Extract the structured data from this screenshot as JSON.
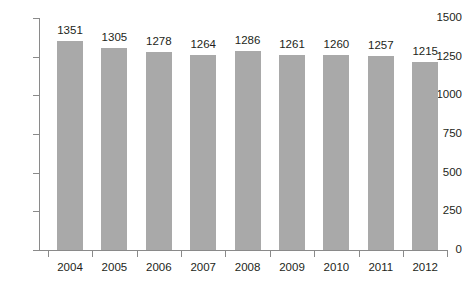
{
  "chart_data": {
    "type": "bar",
    "title": "",
    "subtitle": "",
    "xlabel": "",
    "ylabel": "",
    "categories": [
      "2004",
      "2005",
      "2006",
      "2007",
      "2008",
      "2009",
      "2010",
      "2011",
      "2012"
    ],
    "values": [
      1351,
      1305,
      1278,
      1264,
      1286,
      1261,
      1260,
      1257,
      1215
    ],
    "data_labels": [
      "1351",
      "1305",
      "1278",
      "1264",
      "1286",
      "1261",
      "1260",
      "1257",
      "1215"
    ],
    "ylim": [
      0,
      1500
    ],
    "yticks": [
      0,
      250,
      500,
      750,
      1000,
      1250,
      1500
    ],
    "ytick_labels": [
      "0",
      "250",
      "500",
      "750",
      "1000",
      "1250",
      "1500"
    ],
    "grid": false,
    "legend": null,
    "legend_position": "none",
    "series": [
      {
        "name": "",
        "values": [
          1351,
          1305,
          1278,
          1264,
          1286,
          1261,
          1260,
          1257,
          1215
        ]
      }
    ],
    "colors": {
      "bar": "#a9a9a9",
      "axis": "#8a8a8a",
      "text": "#231f20",
      "background": "#ffffff"
    }
  }
}
